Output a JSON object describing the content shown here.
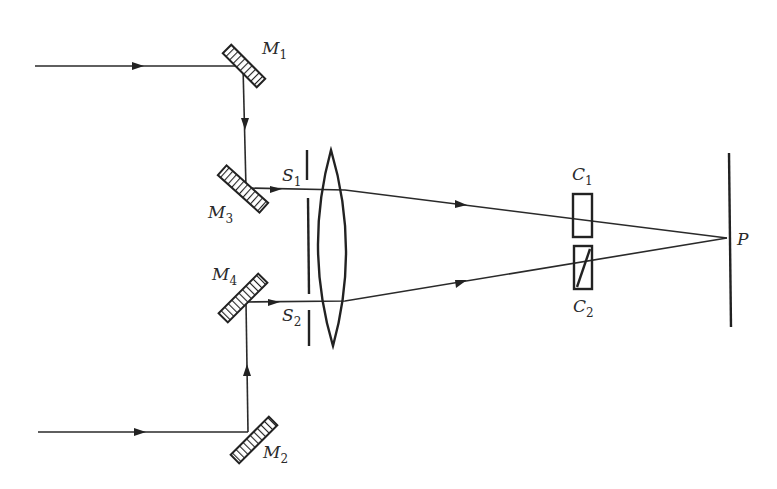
{
  "figure": {
    "type": "optical setup schematic"
  },
  "labels": {
    "M1": {
      "letter": "M",
      "sub": "1"
    },
    "M2": {
      "letter": "M",
      "sub": "2"
    },
    "M3": {
      "letter": "M",
      "sub": "3"
    },
    "M4": {
      "letter": "M",
      "sub": "4"
    },
    "S1": {
      "letter": "S",
      "sub": "1"
    },
    "S2": {
      "letter": "S",
      "sub": "2"
    },
    "C1": {
      "letter": "C",
      "sub": "1"
    },
    "C2": {
      "letter": "C",
      "sub": "2"
    },
    "P": {
      "letter": "P"
    }
  },
  "components": [
    {
      "id": "M1",
      "kind": "mirror"
    },
    {
      "id": "M2",
      "kind": "mirror"
    },
    {
      "id": "M3",
      "kind": "mirror"
    },
    {
      "id": "M4",
      "kind": "mirror"
    },
    {
      "id": "slit-screen",
      "kind": "double slit (S1, S2)"
    },
    {
      "id": "lens",
      "kind": "biconvex lens"
    },
    {
      "id": "C1",
      "kind": "cell"
    },
    {
      "id": "C2",
      "kind": "cell with diagonal (compensator)"
    },
    {
      "id": "screen",
      "kind": "observation screen",
      "point": "P"
    }
  ],
  "colors": {
    "ink": "#222222",
    "background": "#ffffff"
  }
}
